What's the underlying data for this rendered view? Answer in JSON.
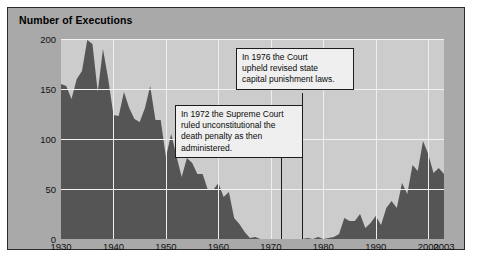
{
  "figure": {
    "title": "Number of Executions",
    "panel_color": "#a9a9a9",
    "plot_color": "#cccccc",
    "area_color": "#555555",
    "grid_color": "#f2f2f2",
    "border_color": "#2b2b2b"
  },
  "annotations": [
    {
      "id": "callout-1976",
      "year": 1976,
      "lines": [
        "In 1976 the Court",
        "upheld revised state",
        "capital punishment laws."
      ]
    },
    {
      "id": "callout-1972",
      "year": 1972,
      "lines": [
        "In 1972 the Supreme Court",
        "ruled unconstitutional the",
        "death penalty as then",
        "administered."
      ]
    }
  ],
  "chart_data": {
    "type": "area",
    "title": "Number of Executions",
    "xlabel": "",
    "ylabel": "Number of Executions",
    "xlim": [
      1930,
      2003
    ],
    "ylim": [
      0,
      200
    ],
    "grid": true,
    "legend": null,
    "ytick_labels": [
      "0",
      "50",
      "100",
      "150",
      "200"
    ],
    "ytick_values": [
      0,
      50,
      100,
      150,
      200
    ],
    "xtick_labels": [
      "1930",
      "1940",
      "1950",
      "1960",
      "1970",
      "1980",
      "1990",
      "2000",
      "2003"
    ],
    "xtick_values": [
      1930,
      1940,
      1950,
      1960,
      1970,
      1980,
      1990,
      2000,
      2003
    ],
    "x": [
      1930,
      1931,
      1932,
      1933,
      1934,
      1935,
      1936,
      1937,
      1938,
      1939,
      1940,
      1941,
      1942,
      1943,
      1944,
      1945,
      1946,
      1947,
      1948,
      1949,
      1950,
      1951,
      1952,
      1953,
      1954,
      1955,
      1956,
      1957,
      1958,
      1959,
      1960,
      1961,
      1962,
      1963,
      1964,
      1965,
      1966,
      1967,
      1968,
      1969,
      1970,
      1971,
      1972,
      1973,
      1974,
      1975,
      1976,
      1977,
      1978,
      1979,
      1980,
      1981,
      1982,
      1983,
      1984,
      1985,
      1986,
      1987,
      1988,
      1989,
      1990,
      1991,
      1992,
      1993,
      1994,
      1995,
      1996,
      1997,
      1998,
      1999,
      2000,
      2001,
      2002,
      2003
    ],
    "values": [
      155,
      153,
      140,
      160,
      168,
      199,
      195,
      147,
      190,
      160,
      124,
      123,
      147,
      131,
      120,
      117,
      131,
      153,
      119,
      119,
      82,
      105,
      83,
      62,
      81,
      76,
      65,
      65,
      49,
      49,
      56,
      42,
      47,
      21,
      15,
      7,
      1,
      2,
      0,
      0,
      0,
      0,
      0,
      0,
      0,
      0,
      0,
      1,
      0,
      2,
      0,
      1,
      2,
      5,
      21,
      18,
      18,
      25,
      11,
      16,
      23,
      14,
      31,
      38,
      31,
      56,
      45,
      74,
      68,
      98,
      85,
      66,
      71,
      65
    ],
    "annotations": [
      {
        "year": 1972,
        "text": "In 1972 the Supreme Court ruled unconstitutional the death penalty as then administered."
      },
      {
        "year": 1976,
        "text": "In 1976 the Court upheld revised state capital punishment laws."
      }
    ]
  }
}
